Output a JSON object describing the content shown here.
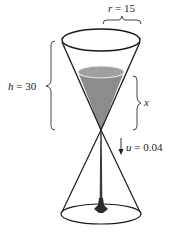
{
  "figure": {
    "labels": {
      "radius": {
        "symbol": "r",
        "eq": " = ",
        "value": "15"
      },
      "height": {
        "symbol": "h",
        "eq": " = ",
        "value": "30"
      },
      "depth": {
        "symbol": "x"
      },
      "flow": {
        "symbol": "u",
        "eq": " = ",
        "value": "0.04"
      }
    },
    "colors": {
      "stroke": "#1a1a1a",
      "liquid": "#8c8c8c",
      "liquid_surface": "#9e9e9e",
      "liquid_rim": "#e6e6e6",
      "puddle": "#2b2b2b",
      "background": "#ffffff"
    }
  }
}
